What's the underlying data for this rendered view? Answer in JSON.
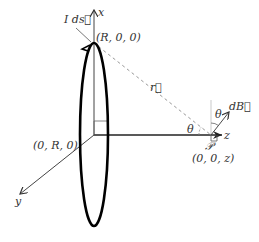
{
  "diagram": {
    "type": "physics-biot-savart-ring",
    "labels": {
      "axis_x": "x",
      "axis_y": "y",
      "axis_z": "z",
      "current_element": "I ds⃗",
      "point_top": "(R, 0, 0)",
      "point_side": "(0, R, 0)",
      "vector_r": "r⃗",
      "angle_left": "θ",
      "angle_right": "θ",
      "field_element": "dB⃗",
      "point_P": "𝒫",
      "point_P_coords": "(0, 0, z)"
    },
    "colors": {
      "ring": "#000000",
      "axes": "#333333",
      "dashed_r": "#999999",
      "guide": "#aaaaaa"
    }
  }
}
